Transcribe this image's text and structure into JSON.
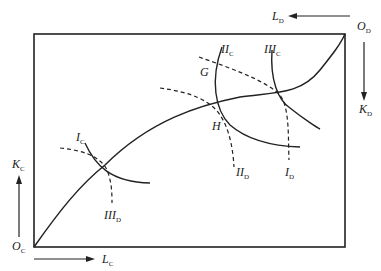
{
  "diagram": {
    "type": "edgeworth-box-production",
    "colors": {
      "line": "#222222",
      "background": "#ffffff"
    },
    "origins": {
      "c": {
        "main": "O",
        "sub": "C"
      },
      "d": {
        "main": "O",
        "sub": "D"
      }
    },
    "axes": {
      "l_c": {
        "main": "L",
        "sub": "C"
      },
      "k_c": {
        "main": "K",
        "sub": "C"
      },
      "l_d": {
        "main": "L",
        "sub": "D"
      },
      "k_d": {
        "main": "K",
        "sub": "D"
      }
    },
    "isoquants_c": [
      {
        "main": "I",
        "sub": "C"
      },
      {
        "main": "II",
        "sub": "C"
      },
      {
        "main": "III",
        "sub": "C"
      }
    ],
    "isoquants_d": [
      {
        "main": "I",
        "sub": "D"
      },
      {
        "main": "II",
        "sub": "D"
      },
      {
        "main": "III",
        "sub": "D"
      }
    ],
    "points": {
      "g": "G",
      "h": "H"
    }
  }
}
